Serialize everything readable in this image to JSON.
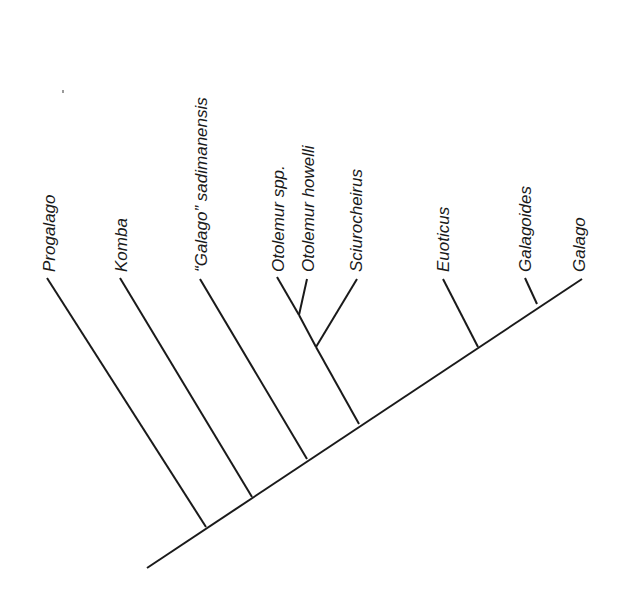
{
  "diagram": {
    "type": "cladogram",
    "orientation": "diagonal-right",
    "colors": {
      "line": "#1a1a1a",
      "text": "#1a1a1a",
      "background": "#ffffff"
    },
    "root": {
      "x": 147,
      "y": 568
    },
    "spine_end": {
      "x": 582,
      "y": 279
    },
    "taxa": [
      {
        "id": "progalago",
        "label": "Progalago",
        "tip": [
          47,
          278
        ],
        "node": [
          206,
          527
        ]
      },
      {
        "id": "komba",
        "label": "Komba",
        "tip": [
          120,
          278
        ],
        "node": [
          252,
          497
        ]
      },
      {
        "id": "g-sadimanensis",
        "label": "“Galago” sadimanensis",
        "tip": [
          200,
          279
        ],
        "node": [
          307,
          459
        ]
      },
      {
        "id": "otolemur-spp",
        "label": "Otolemur spp.",
        "tip": [
          277,
          277
        ],
        "node": [
          299,
          315
        ]
      },
      {
        "id": "otolemur-howelli",
        "label": "Otolemur howelli",
        "tip": [
          307,
          279
        ],
        "node": [
          299,
          315
        ]
      },
      {
        "id": "sciurocheirus",
        "label": "Sciurocheirus",
        "tip": [
          357,
          279
        ],
        "node": [
          316,
          347
        ]
      },
      {
        "id": "euoticus",
        "label": "Euoticus",
        "tip": [
          443,
          279
        ],
        "node": [
          478,
          347
        ]
      },
      {
        "id": "galagoides",
        "label": "Galagoides",
        "tip": [
          525,
          278
        ],
        "node": [
          537,
          304
        ]
      },
      {
        "id": "galago",
        "label": "Galago",
        "tip": [
          582,
          279
        ],
        "node": [
          582,
          279
        ]
      }
    ],
    "internal_nodes": [
      {
        "id": "otolemur-clade",
        "from": [
          316,
          347
        ],
        "to": [
          299,
          315
        ]
      },
      {
        "id": "otolemur-sciurocheirus-clade",
        "from": [
          359,
          424
        ],
        "to": [
          316,
          347
        ]
      }
    ]
  }
}
